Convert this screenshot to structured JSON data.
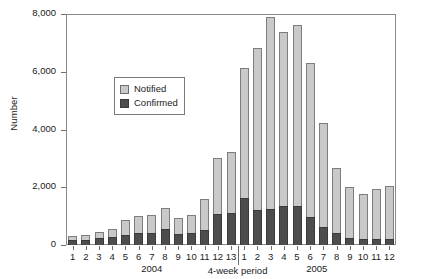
{
  "chart_data": {
    "type": "bar",
    "subtype": "stacked-vertical",
    "title": "",
    "xlabel": "4-week period",
    "ylabel": "Number",
    "ylim": [
      0,
      8000
    ],
    "yticks": [
      0,
      2000,
      4000,
      6000,
      8000
    ],
    "ytick_labels": [
      "0",
      "2,000",
      "4,000",
      "6,000",
      "8,000"
    ],
    "grid": false,
    "legend_position": "inside-upper-left",
    "categories": [
      "1",
      "2",
      "3",
      "4",
      "5",
      "6",
      "7",
      "8",
      "9",
      "10",
      "11",
      "12",
      "13",
      "1",
      "2",
      "3",
      "4",
      "5",
      "6",
      "7",
      "8",
      "9",
      "10",
      "11",
      "12"
    ],
    "group_labels": [
      "2004",
      "2005"
    ],
    "group_sizes": [
      13,
      12
    ],
    "series": [
      {
        "name": "Confirmed",
        "color": "#4d4d4d",
        "values": [
          180,
          180,
          250,
          280,
          350,
          400,
          430,
          540,
          370,
          400,
          520,
          1060,
          1120,
          1640,
          1200,
          1230,
          1350,
          1340,
          960,
          620,
          430,
          230,
          210,
          200,
          200
        ]
      },
      {
        "name": "Notified",
        "color": "#c9c9c9",
        "values": [
          130,
          170,
          200,
          290,
          510,
          600,
          610,
          740,
          560,
          650,
          1080,
          1940,
          2090,
          4480,
          5640,
          6660,
          6020,
          6270,
          5360,
          3590,
          2240,
          1770,
          1560,
          1740,
          1860
        ]
      }
    ],
    "totals": [
      310,
      350,
      450,
      570,
      860,
      1000,
      1040,
      1280,
      930,
      1050,
      1600,
      3000,
      3210,
      6120,
      6840,
      7890,
      7370,
      7610,
      6320,
      4210,
      2670,
      2000,
      1770,
      1940,
      2060
    ]
  },
  "legend": {
    "items": [
      {
        "label": "Notified",
        "key": "notified"
      },
      {
        "label": "Confirmed",
        "key": "confirmed"
      }
    ]
  }
}
